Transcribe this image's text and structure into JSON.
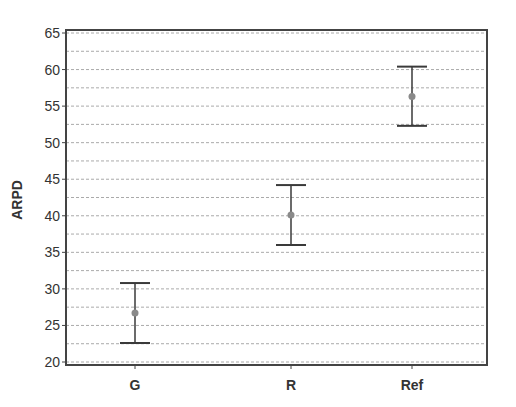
{
  "chart_data": {
    "type": "errorbar",
    "title": "",
    "xlabel": "",
    "ylabel": "ARPD",
    "categories": [
      "G",
      "R",
      "Ref"
    ],
    "series": [
      {
        "name": "ARPD",
        "mean": [
          26.7,
          40.1,
          56.3
        ],
        "lower": [
          22.6,
          36.0,
          52.3
        ],
        "upper": [
          30.8,
          44.2,
          60.4
        ]
      }
    ],
    "ylim": [
      20,
      65
    ],
    "yticks": [
      20,
      25,
      30,
      35,
      40,
      45,
      50,
      55,
      60,
      65
    ],
    "grid": {
      "on": true,
      "style": "dashed",
      "step": 2.5
    },
    "legend": null
  },
  "colors": {
    "point": "#8a8a8a",
    "errorbar": "#3a3a3a",
    "grid": "#aaaaaa",
    "frame": "#444444"
  }
}
